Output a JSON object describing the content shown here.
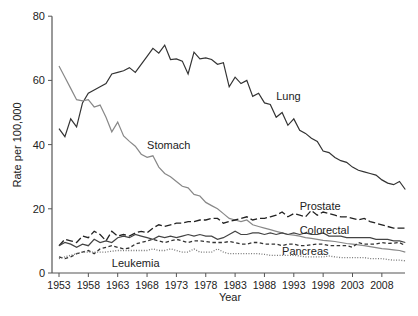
{
  "chart_data": {
    "type": "line",
    "title": "",
    "xlabel": "Year",
    "ylabel": "Rate per 100,000",
    "xlim": [
      1953,
      2012
    ],
    "ylim": [
      0,
      80
    ],
    "grid": false,
    "legend": "inline labels",
    "x_ticks": [
      1953,
      1958,
      1963,
      1968,
      1973,
      1978,
      1983,
      1988,
      1993,
      1998,
      2003,
      2008
    ],
    "y_ticks": [
      0,
      20,
      40,
      60,
      80
    ],
    "x": [
      1953,
      1954,
      1955,
      1956,
      1957,
      1958,
      1959,
      1960,
      1961,
      1962,
      1963,
      1964,
      1965,
      1966,
      1967,
      1968,
      1969,
      1970,
      1971,
      1972,
      1973,
      1974,
      1975,
      1976,
      1977,
      1978,
      1979,
      1980,
      1981,
      1982,
      1983,
      1984,
      1985,
      1986,
      1987,
      1988,
      1989,
      1990,
      1991,
      1992,
      1993,
      1994,
      1995,
      1996,
      1997,
      1998,
      1999,
      2000,
      2001,
      2002,
      2003,
      2004,
      2005,
      2006,
      2007,
      2008,
      2009,
      2010,
      2011,
      2012
    ],
    "series": [
      {
        "name": "Lung",
        "style": "solid",
        "color": "#333333",
        "values": [
          45,
          42.5,
          48,
          45.5,
          53,
          56,
          57,
          58,
          59,
          62,
          62.5,
          63,
          64,
          62.5,
          65,
          67.5,
          70,
          68.5,
          71,
          66.5,
          66.7,
          66,
          62,
          68.8,
          66.7,
          67,
          66.5,
          65,
          65.5,
          58,
          61,
          59,
          60,
          55,
          56,
          53,
          52.5,
          48.5,
          50,
          46,
          48,
          44.5,
          43.5,
          42,
          41,
          38,
          37.5,
          36,
          35,
          34.5,
          33,
          32,
          31.5,
          31,
          30.5,
          29,
          28,
          27.5,
          28.5,
          26
        ]
      },
      {
        "name": "Stomach",
        "style": "solid",
        "color": "#888888",
        "values": [
          64.5,
          61,
          57.5,
          54,
          53.6,
          54,
          51.7,
          52.3,
          48.5,
          44,
          47,
          42.7,
          41,
          39.5,
          37,
          36,
          36.5,
          33,
          31,
          30,
          28.5,
          27,
          26.5,
          24.5,
          24,
          22,
          21,
          20,
          18.5,
          17,
          16.5,
          16,
          16.5,
          15,
          14.5,
          14,
          13.5,
          13,
          12.5,
          12,
          11.8,
          11.5,
          11,
          10.8,
          10.5,
          10.2,
          10,
          9.8,
          9.5,
          9.2,
          9,
          8.8,
          8.5,
          8.2,
          7.9,
          7.6,
          7.4,
          7.2,
          7,
          6.5
        ]
      },
      {
        "name": "Prostate",
        "style": "dashed",
        "color": "#222222",
        "values": [
          8.5,
          10.5,
          10,
          9.5,
          11.5,
          11,
          13,
          12,
          10,
          13,
          11.5,
          12,
          11.5,
          12.5,
          13,
          12.5,
          14,
          15,
          14.5,
          15,
          15.5,
          15.5,
          16,
          16,
          16.5,
          16.5,
          17,
          17,
          15.5,
          16,
          16.5,
          17,
          17.5,
          16.5,
          17,
          17,
          17.5,
          18,
          19,
          17.5,
          18.5,
          18,
          17.5,
          19.5,
          18,
          19,
          18.5,
          18,
          17.5,
          17.5,
          17,
          16.5,
          17,
          16,
          15.5,
          15,
          14.5,
          14,
          14,
          14
        ]
      },
      {
        "name": "Colorectal",
        "style": "solid",
        "color": "#444444",
        "values": [
          8.5,
          9.5,
          9,
          8,
          9,
          8.5,
          10.5,
          9.5,
          10,
          9.5,
          11,
          11.5,
          11,
          12,
          11.5,
          11,
          10.5,
          11.5,
          11,
          11.5,
          11,
          11.5,
          12,
          11.5,
          12,
          11.5,
          11.5,
          10.5,
          11,
          12,
          13,
          12,
          12,
          12.5,
          12.5,
          12,
          12.5,
          12,
          12.5,
          12,
          12.5,
          12,
          12.5,
          12,
          12,
          12.5,
          11.5,
          11.5,
          11.5,
          11,
          11,
          11,
          11,
          11,
          10.5,
          10.5,
          10.5,
          10,
          10,
          9.5
        ]
      },
      {
        "name": "Pancreas",
        "style": "short-dashed",
        "color": "#333333",
        "values": [
          5,
          4.5,
          5,
          6,
          6.5,
          7,
          6,
          7.5,
          8,
          8.5,
          8,
          7.5,
          7.8,
          9,
          9.5,
          10,
          10.5,
          10,
          9.5,
          10,
          10.5,
          10,
          9.5,
          10,
          10,
          9.8,
          9.5,
          9.5,
          9.5,
          9.8,
          9.5,
          9,
          9,
          9.5,
          9.5,
          9,
          9,
          9,
          8.5,
          9,
          9,
          8.5,
          8.5,
          8.8,
          9,
          9,
          8.5,
          8.5,
          8.5,
          8.5,
          8,
          9.5,
          9,
          9,
          9,
          9.5,
          9.2,
          9.3,
          9.5,
          8.5
        ]
      },
      {
        "name": "Leukemia",
        "style": "dotted",
        "color": "#777777",
        "values": [
          4.5,
          5,
          5.5,
          6,
          6.5,
          6.5,
          6.5,
          6.5,
          6.5,
          6.8,
          7,
          7,
          7,
          7,
          7,
          7,
          7.5,
          7,
          7,
          7.5,
          7,
          6.5,
          6.5,
          7.5,
          6.5,
          6.5,
          6.5,
          7.5,
          6.5,
          6,
          6,
          6,
          6,
          6,
          6,
          5.8,
          5.5,
          5.5,
          5.5,
          5.5,
          5.5,
          5.3,
          5,
          5,
          5,
          5,
          5.3,
          5,
          4.8,
          4.8,
          4.8,
          4.8,
          4.8,
          4.5,
          4.5,
          4.5,
          4.2,
          4,
          4,
          3.8
        ]
      }
    ],
    "annotations": [
      {
        "text": "Lung",
        "x": 1990,
        "y": 55
      },
      {
        "text": "Stomach",
        "x": 1968,
        "y": 40
      },
      {
        "text": "Prostate",
        "x": 1994,
        "y": 21
      },
      {
        "text": "Colorectal",
        "x": 1994,
        "y": 13.5
      },
      {
        "text": "Pancreas",
        "x": 1991,
        "y": 7
      },
      {
        "text": "Leukemia",
        "x": 1962,
        "y": 3
      }
    ]
  },
  "labels": {
    "xlabel": "Year",
    "ylabel": "Rate per 100,000",
    "lung": "Lung",
    "stomach": "Stomach",
    "prostate": "Prostate",
    "colorectal": "Colorectal",
    "pancreas": "Pancreas",
    "leukemia": "Leukemia"
  }
}
